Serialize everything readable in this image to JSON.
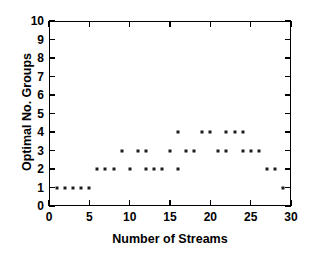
{
  "chart_data": {
    "type": "scatter",
    "title": "",
    "xlabel": "Number of Streams",
    "ylabel": "Optimal No. Groups",
    "xlim": [
      0,
      30
    ],
    "ylim": [
      0,
      10
    ],
    "xticks": [
      0,
      5,
      10,
      15,
      20,
      25,
      30
    ],
    "yticks": [
      0,
      1,
      2,
      3,
      4,
      5,
      6,
      7,
      8,
      9,
      10
    ],
    "xtick_labels": [
      "0",
      "5",
      "10",
      "15",
      "20",
      "25",
      "30"
    ],
    "ytick_labels": [
      "0",
      "1",
      "2",
      "3",
      "4",
      "5",
      "6",
      "7",
      "8",
      "9",
      "10"
    ],
    "grid": false,
    "legend": false,
    "marker": "square-dot",
    "marker_color": "#1a1a1a",
    "points": [
      {
        "x": 1,
        "y": 1
      },
      {
        "x": 2,
        "y": 1
      },
      {
        "x": 3,
        "y": 1
      },
      {
        "x": 4,
        "y": 1
      },
      {
        "x": 5,
        "y": 1
      },
      {
        "x": 6,
        "y": 2
      },
      {
        "x": 7,
        "y": 2
      },
      {
        "x": 8,
        "y": 2
      },
      {
        "x": 9,
        "y": 3
      },
      {
        "x": 10,
        "y": 2
      },
      {
        "x": 11,
        "y": 3
      },
      {
        "x": 12,
        "y": 3
      },
      {
        "x": 12,
        "y": 2
      },
      {
        "x": 13,
        "y": 2
      },
      {
        "x": 14,
        "y": 2
      },
      {
        "x": 15,
        "y": 3
      },
      {
        "x": 16,
        "y": 4
      },
      {
        "x": 16,
        "y": 2
      },
      {
        "x": 17,
        "y": 3
      },
      {
        "x": 18,
        "y": 3
      },
      {
        "x": 19,
        "y": 4
      },
      {
        "x": 20,
        "y": 4
      },
      {
        "x": 21,
        "y": 3
      },
      {
        "x": 22,
        "y": 4
      },
      {
        "x": 22,
        "y": 3
      },
      {
        "x": 23,
        "y": 4
      },
      {
        "x": 24,
        "y": 4
      },
      {
        "x": 24,
        "y": 3
      },
      {
        "x": 25,
        "y": 3
      },
      {
        "x": 26,
        "y": 3
      },
      {
        "x": 27,
        "y": 2
      },
      {
        "x": 28,
        "y": 2
      },
      {
        "x": 29,
        "y": 1
      }
    ]
  }
}
